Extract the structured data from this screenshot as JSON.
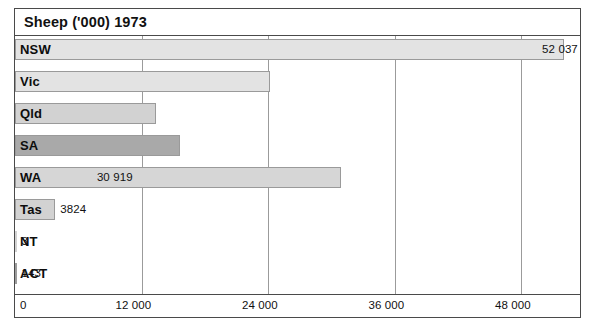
{
  "chart_data": {
    "type": "bar",
    "orientation": "horizontal",
    "title": "Sheep ('000) 1973",
    "xlabel": "",
    "ylabel": "",
    "xlim": [
      0,
      53800
    ],
    "grid": true,
    "legend": "none",
    "categories": [
      "NSW",
      "Vic",
      "Qld",
      "SA",
      "WA",
      "Tas",
      "NT",
      "ACT"
    ],
    "values": [
      52037,
      24186,
      13346,
      15651,
      30919,
      3824,
      3,
      143
    ],
    "value_labels": [
      "52 037",
      "24 186",
      "13 346",
      "15 651",
      "30 919",
      "3824",
      "3",
      "143"
    ],
    "tick_values": [
      0,
      12000,
      24000,
      36000,
      48000
    ],
    "tick_labels": [
      "0",
      "12 000",
      "24 000",
      "36 000",
      "48 000"
    ],
    "bar_colors": [
      "#e3e3e3",
      "#e3e3e3",
      "#d2d2d2",
      "#a9a9a9",
      "#d6d6d6",
      "#d2d2d2",
      "#d2d2d2",
      "#9c9c9c"
    ],
    "label_placement": [
      "inside",
      "inside",
      "inside",
      "inside",
      "inside",
      "outside",
      "outside",
      "outside"
    ],
    "bars": [
      {
        "category": "NSW",
        "value": 52037,
        "value_label": "52 037",
        "color": "#e3e3e3",
        "label_placement": "inside"
      },
      {
        "category": "Vic",
        "value": 24186,
        "value_label": "24 186",
        "color": "#e3e3e3",
        "label_placement": "inside"
      },
      {
        "category": "Qld",
        "value": 13346,
        "value_label": "13 346",
        "color": "#d2d2d2",
        "label_placement": "inside"
      },
      {
        "category": "SA",
        "value": 15651,
        "value_label": "15 651",
        "color": "#a9a9a9",
        "label_placement": "inside"
      },
      {
        "category": "WA",
        "value": 30919,
        "value_label": "30 919",
        "color": "#d6d6d6",
        "label_placement": "inside"
      },
      {
        "category": "Tas",
        "value": 3824,
        "value_label": "3824",
        "color": "#d2d2d2",
        "label_placement": "outside"
      },
      {
        "category": "NT",
        "value": 3,
        "value_label": "3",
        "color": "#d2d2d2",
        "label_placement": "outside"
      },
      {
        "category": "ACT",
        "value": 143,
        "value_label": "143",
        "color": "#9c9c9c",
        "label_placement": "outside"
      }
    ]
  }
}
